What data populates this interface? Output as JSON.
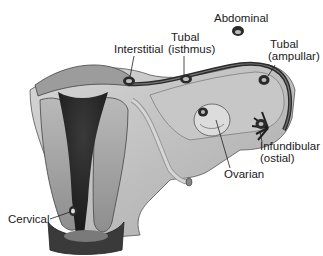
{
  "diagram": {
    "type": "anatomical-illustration",
    "labels": [
      {
        "id": "abdominal",
        "lines": [
          "Abdominal"
        ],
        "x": 214,
        "y": 12
      },
      {
        "id": "interstitial",
        "lines": [
          "Interstitial"
        ],
        "x": 116,
        "y": 45
      },
      {
        "id": "tubal_isthmus",
        "lines": [
          "Tubal",
          "(isthmus)"
        ],
        "x": 168,
        "y": 33
      },
      {
        "id": "tubal_ampullar",
        "lines": [
          "Tubal",
          "(ampullar)"
        ],
        "x": 268,
        "y": 40
      },
      {
        "id": "infundibular_ostial",
        "lines": [
          "Infundibular",
          "(ostial)"
        ],
        "x": 260,
        "y": 140
      },
      {
        "id": "ovarian",
        "lines": [
          "Ovarian"
        ],
        "x": 225,
        "y": 168
      },
      {
        "id": "cervical",
        "lines": [
          "Cervical"
        ],
        "x": 8,
        "y": 213
      }
    ]
  }
}
